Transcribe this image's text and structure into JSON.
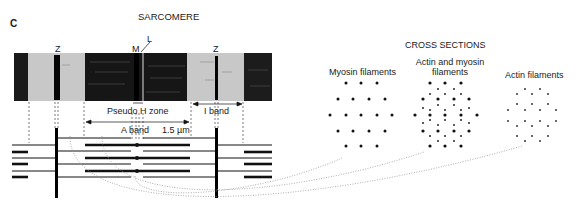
{
  "panel_label": "C",
  "title": "SARCOMERE",
  "micrograph_labels": {
    "z_left": "Z",
    "m": "M",
    "l": "L",
    "z_right": "Z"
  },
  "annotations": {
    "pseudo_h_zone": "Pseudo H zone",
    "i_band": "I band",
    "a_band": "A band",
    "scale": "1.5 µm"
  },
  "cross_sections": {
    "title": "CROSS SECTIONS",
    "panels": [
      {
        "label": "Myosin filaments"
      },
      {
        "label_line1": "Actin and myosin",
        "label_line2": "filaments"
      },
      {
        "label": "Actin filaments"
      }
    ]
  },
  "colors": {
    "band_gray": "#c8c8c8",
    "ink": "#111111",
    "dots": "#9a9a9a"
  }
}
